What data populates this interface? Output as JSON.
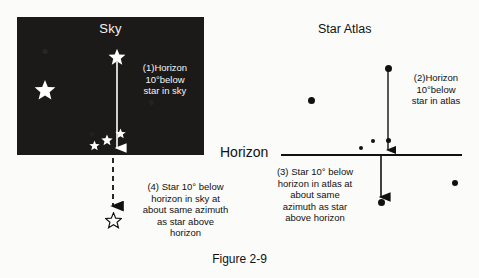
{
  "figure": {
    "caption": "Figure 2-9",
    "horizon_label": "Horizon"
  },
  "sky_panel": {
    "title": "Sky",
    "background_color": "#1b1a19",
    "star_color": "#ffffff",
    "annotation": "(1)Horizon\n10°below\nstar in sky",
    "stars": [
      {
        "name": "bright-star-left",
        "x": 45,
        "y": 90,
        "size": 22,
        "filled": true
      },
      {
        "name": "bright-star-upper",
        "x": 117,
        "y": 57,
        "size": 18,
        "filled": true
      },
      {
        "name": "small-star-a",
        "x": 95,
        "y": 146,
        "size": 11,
        "filled": true
      },
      {
        "name": "small-star-b",
        "x": 107,
        "y": 140,
        "size": 12,
        "filled": true
      },
      {
        "name": "small-star-c",
        "x": 121,
        "y": 134,
        "size": 11,
        "filled": true
      }
    ]
  },
  "sky_below_horizon": {
    "annotation": "(4) Star 10° below\nhorizon in sky at\nabout same azimuth\nas star above\nhorizon",
    "outline_star": {
      "x": 113,
      "y": 220,
      "size": 16,
      "filled": false
    }
  },
  "atlas_panel": {
    "title": "Star Atlas",
    "annotation_above": "(2)Horizon\n10°below\nstar in atlas",
    "annotation_below": "(3) Star 10°  below\nhorizon  in atlas at\nabout same\nazimuth as star\nabove horizon",
    "dot_color": "#111111",
    "dots": [
      {
        "name": "atlas-star-top",
        "x": 388,
        "y": 68,
        "size": 6
      },
      {
        "name": "atlas-star-left",
        "x": 311,
        "y": 100,
        "size": 6
      },
      {
        "name": "atlas-star-mid",
        "x": 388,
        "y": 140,
        "size": 4
      },
      {
        "name": "atlas-star-small-a",
        "x": 373,
        "y": 141,
        "size": 4
      },
      {
        "name": "atlas-star-small-b",
        "x": 361,
        "y": 148,
        "size": 4
      },
      {
        "name": "atlas-star-right",
        "x": 455,
        "y": 183,
        "size": 5
      },
      {
        "name": "atlas-star-below-horizon",
        "x": 385,
        "y": 203,
        "size": 6
      }
    ]
  },
  "arrows": {
    "sky_solid": {
      "name": "sky-downward-arrow",
      "x": 117,
      "y1": 62,
      "y2": 152
    },
    "sky_dashed": {
      "name": "sky-dashed-arrow",
      "x": 113,
      "y1": 158,
      "y2": 210
    },
    "atlas_upper": {
      "name": "atlas-upper-arrow",
      "x": 388,
      "y1": 70,
      "y2": 154
    },
    "atlas_lower": {
      "name": "atlas-lower-arrow",
      "x": 381,
      "y1": 156,
      "y2": 201
    }
  }
}
